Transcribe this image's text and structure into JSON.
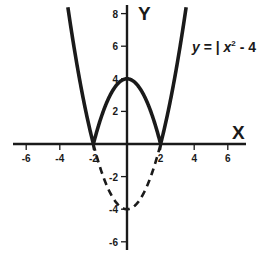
{
  "chart_data": {
    "type": "line",
    "title": "",
    "xlabel": "X",
    "ylabel": "Y",
    "xlim": [
      -7,
      7
    ],
    "ylim": [
      -6.5,
      8.5
    ],
    "grid": false,
    "legend": null,
    "x_ticks": [
      -6,
      -4,
      -2,
      2,
      4,
      6
    ],
    "x_tick_labels": [
      "-6",
      "-4",
      "-2",
      "2",
      "4",
      "6"
    ],
    "y_ticks": [
      8,
      6,
      4,
      2,
      -2,
      -4,
      -6
    ],
    "y_tick_labels": [
      "8",
      "6",
      "4",
      "2",
      "-2",
      "-4",
      "-6"
    ],
    "annotations": [
      {
        "text": "y = | x² - 4 |",
        "position": "upper right, next to right branch"
      }
    ],
    "series": [
      {
        "name": "y = |x² - 4|",
        "style": "solid",
        "x": [
          -3.5,
          -3,
          -2.5,
          -2,
          -1.5,
          -1,
          -0.5,
          0,
          0.5,
          1,
          1.5,
          2,
          2.5,
          3,
          3.5
        ],
        "y": [
          8.25,
          5,
          2.25,
          0,
          1.75,
          3,
          3.75,
          4,
          3.75,
          3,
          1.75,
          0,
          2.25,
          5,
          8.25
        ]
      },
      {
        "name": "y = x² - 4 (reflected part, dashed)",
        "style": "dashed",
        "x": [
          -2,
          -1.5,
          -1,
          -0.5,
          0,
          0.5,
          1,
          1.5,
          2
        ],
        "y": [
          0,
          -1.75,
          -3,
          -3.75,
          -4,
          -3.75,
          -3,
          -1.75,
          0
        ]
      }
    ]
  },
  "labels": {
    "x_axis": "X",
    "y_axis": "Y",
    "equation_prefix": "y",
    "equation_eq": " = | ",
    "equation_x": "x",
    "equation_exp": "2",
    "equation_suffix": " - 4 |"
  },
  "colors": {
    "ink": "#1a1a1a",
    "background": "#ffffff"
  }
}
